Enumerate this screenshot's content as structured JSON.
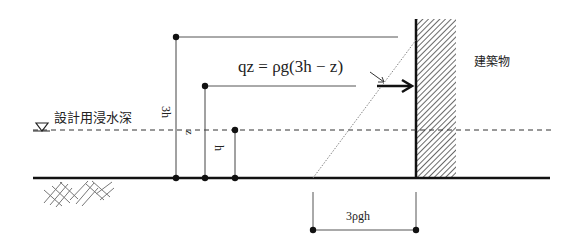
{
  "diagram": {
    "labels": {
      "water_level": "設計用浸水深",
      "building": "建築物",
      "formula": "qz = ρg(3h − z)",
      "height_3h": "3h",
      "height_z": "z",
      "height_h": "h",
      "base_pressure": "3ρgh"
    },
    "colors": {
      "line": "#111111",
      "thin_line": "#555555",
      "hatch": "#444444",
      "background": "#ffffff"
    },
    "elements": [
      {
        "type": "ground-line",
        "description": "地盤面"
      },
      {
        "type": "water-level-line",
        "description": "設計用浸水深 (dashed)"
      },
      {
        "type": "building-wall",
        "description": "建築物 (hatched)"
      },
      {
        "type": "pressure-distribution",
        "description": "triangular distribution, dotted"
      },
      {
        "type": "dimension",
        "label": "3h"
      },
      {
        "type": "dimension",
        "label": "z"
      },
      {
        "type": "dimension",
        "label": "h"
      },
      {
        "type": "dimension",
        "label": "3ρgh"
      },
      {
        "type": "arrow",
        "label": "qz"
      }
    ]
  }
}
